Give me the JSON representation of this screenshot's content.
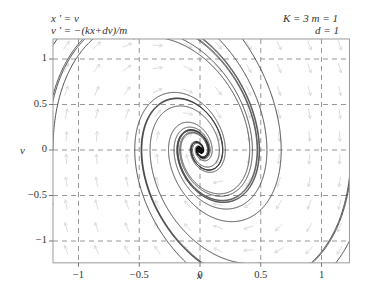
{
  "equations": {
    "line1": "x ′ = v",
    "line2": "v ′ = −(kx+dv)/m"
  },
  "parameters": {
    "line1": "K = 3   m = 1",
    "line2": "d = 1"
  },
  "chart_data": {
    "type": "line",
    "subtitle": "K = 3, m = 1, d = 1",
    "xlabel": "x",
    "ylabel": "v",
    "xlim": [
      -1.21,
      1.23
    ],
    "ylim": [
      -1.24,
      1.22
    ],
    "xticks": [
      -1,
      -0.5,
      0,
      0.5,
      1
    ],
    "xtick_labels": [
      "−1",
      "−0.5",
      "0",
      "0.5",
      "1"
    ],
    "yticks": [
      -1,
      -0.5,
      0,
      0.5,
      1
    ],
    "ytick_labels": [
      "−1",
      "−0.5",
      "0",
      "0.5",
      "1"
    ],
    "grid": true,
    "grid_style": "dashed",
    "params": {
      "k": 3,
      "m": 1,
      "d": 1
    },
    "equilibrium": [
      0,
      0
    ],
    "equilibrium_type": "stable spiral",
    "series": [
      {
        "name": "trajectory",
        "start": [
          -1.21,
          1.15
        ]
      },
      {
        "name": "trajectory",
        "start": [
          -1.21,
          0.6
        ]
      },
      {
        "name": "trajectory",
        "start": [
          -1.21,
          0.0
        ]
      },
      {
        "name": "trajectory",
        "start": [
          -1.21,
          -0.6
        ]
      },
      {
        "name": "trajectory",
        "start": [
          -0.9,
          1.22
        ]
      },
      {
        "name": "trajectory",
        "start": [
          -0.55,
          1.22
        ]
      },
      {
        "name": "trajectory",
        "start": [
          -0.15,
          1.22
        ]
      },
      {
        "name": "trajectory",
        "start": [
          0.35,
          1.22
        ]
      },
      {
        "name": "trajectory",
        "start": [
          1.23,
          -1.0
        ]
      },
      {
        "name": "trajectory",
        "start": [
          1.23,
          -0.3
        ]
      },
      {
        "name": "trajectory",
        "start": [
          1.23,
          0.4
        ]
      },
      {
        "name": "trajectory",
        "start": [
          0.9,
          -1.24
        ]
      },
      {
        "name": "trajectory",
        "start": [
          0.5,
          -1.24
        ]
      }
    ],
    "colors": {
      "trajectory": "#3a3a3a",
      "field_arrows": "#d8d8d8",
      "grid": "#8a8a8a",
      "frame": "#9a9a9a"
    }
  }
}
